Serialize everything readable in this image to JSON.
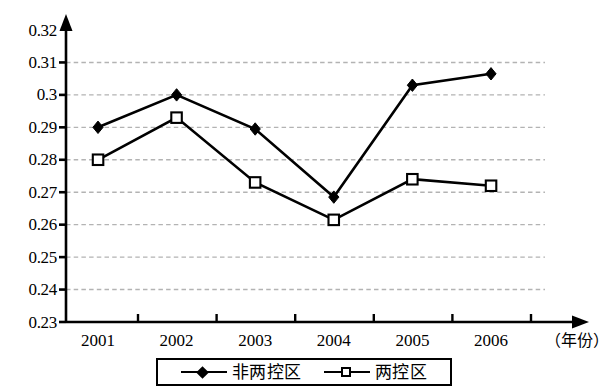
{
  "chart_data": {
    "type": "line",
    "title": "",
    "xlabel": "（年份）",
    "ylabel": "",
    "categories": [
      "2001",
      "2002",
      "2003",
      "2004",
      "2005",
      "2006"
    ],
    "ylim": [
      0.23,
      0.32
    ],
    "ytick_labels": [
      "0.32",
      "0.31",
      "0.3",
      "0.29",
      "0.28",
      "0.27",
      "0.26",
      "0.25",
      "0.24",
      "0.23"
    ],
    "ytick_values": [
      0.32,
      0.31,
      0.3,
      0.29,
      0.28,
      0.27,
      0.26,
      0.25,
      0.24,
      0.23
    ],
    "grid": true,
    "grid_style": "dashed",
    "grid_color": "#b3b3b3",
    "legend_position": "bottom",
    "series": [
      {
        "name": "非两控区",
        "marker": "filled-diamond",
        "color": "#000000",
        "values": [
          0.29,
          0.3,
          0.2895,
          0.2685,
          0.303,
          0.3065
        ]
      },
      {
        "name": "两控区",
        "marker": "open-square",
        "color": "#000000",
        "values": [
          0.28,
          0.293,
          0.273,
          0.2615,
          0.274,
          0.272
        ]
      }
    ]
  },
  "axis": {
    "y_arrow": true,
    "x_arrow": true
  },
  "legend": {
    "entries": [
      {
        "label": "非两控区",
        "marker": "filled-diamond"
      },
      {
        "label": "两控区",
        "marker": "open-square"
      }
    ]
  }
}
